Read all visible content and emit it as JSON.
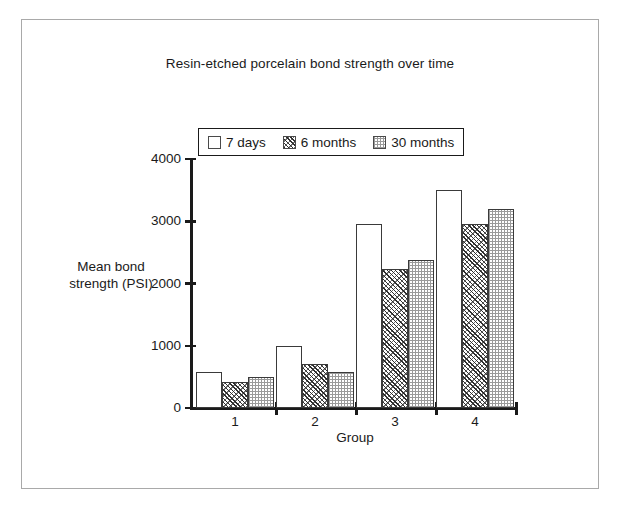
{
  "chart_data": {
    "type": "bar",
    "title": "Resin-etched porcelain bond strength over time",
    "xlabel": "Group",
    "ylabel": "Mean bond strength (PSI)",
    "ylabel_line1": "Mean bond",
    "ylabel_line2": "strength (PSI)",
    "categories": [
      "1",
      "2",
      "3",
      "4"
    ],
    "ylim": [
      0,
      4000
    ],
    "yticks": [
      0,
      1000,
      2000,
      3000,
      4000
    ],
    "ytick_labels": [
      "0",
      "1000",
      "2000",
      "3000",
      "4000"
    ],
    "grid": false,
    "legend_position": "top-center",
    "series": [
      {
        "name": "7 days",
        "pattern": "plain",
        "values": [
          580,
          1000,
          2950,
          3500
        ]
      },
      {
        "name": "6 months",
        "pattern": "hatch",
        "values": [
          420,
          710,
          2240,
          2950
        ]
      },
      {
        "name": "30 months",
        "pattern": "dots",
        "values": [
          500,
          580,
          2370,
          3200
        ]
      }
    ]
  },
  "legend": {
    "items": [
      {
        "label": "7 days"
      },
      {
        "label": "6 months"
      },
      {
        "label": "30 months"
      }
    ]
  }
}
